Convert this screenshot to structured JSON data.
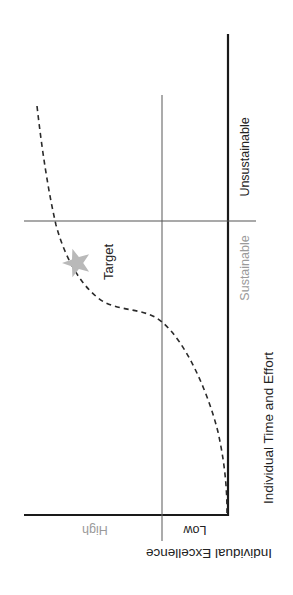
{
  "diagram": {
    "type": "quadrant-curve",
    "orientation": "rotated-90",
    "x_axis": {
      "label": "Individual Time and Effort",
      "regions": [
        {
          "label": "Sustainable",
          "color": "#9a9a9a"
        },
        {
          "label": "Unsustainable",
          "color": "#222222"
        }
      ]
    },
    "y_axis": {
      "label": "Individual Excellence",
      "regions": [
        {
          "label": "Low",
          "color": "#222222"
        },
        {
          "label": "High",
          "color": "#9a9a9a"
        }
      ]
    },
    "curve": {
      "style": "dashed",
      "description": "S-curve: flat at low effort, rising steeply, then leveling off at high effort"
    },
    "marker": {
      "label": "Target",
      "shape": "star",
      "color": "#b9b9b9"
    },
    "colors": {
      "axis": "#1a1a1a",
      "divider": "#555555",
      "curve": "#2a2a2a"
    }
  }
}
